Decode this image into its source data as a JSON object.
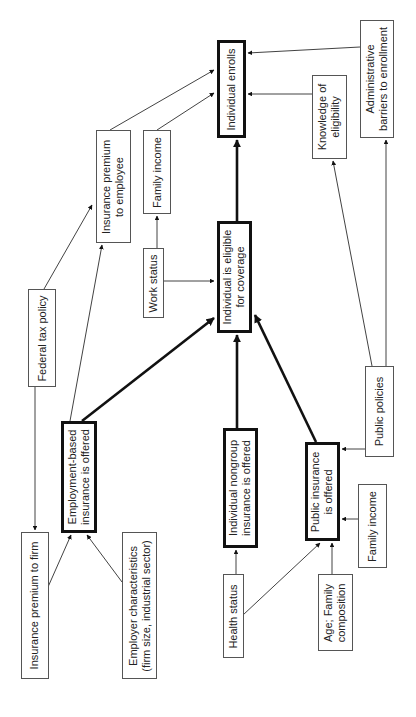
{
  "diagram": {
    "title": "",
    "type": "flowchart",
    "orientation": "rotated-90-ccw",
    "nodes": {
      "individual_enrolls": {
        "lines": [
          "Individual enrolls"
        ],
        "emphasis": "thick"
      },
      "admin_barriers": {
        "lines": [
          "Administrative",
          "barriers to enrollment"
        ],
        "emphasis": "thin"
      },
      "knowledge_eligibility": {
        "lines": [
          "Knowledge of",
          "eligibility"
        ],
        "emphasis": "thin"
      },
      "premium_employee": {
        "lines": [
          "Insurance premium",
          "to employee"
        ],
        "emphasis": "thin"
      },
      "family_income_top": {
        "lines": [
          "Family income"
        ],
        "emphasis": "thin"
      },
      "work_status": {
        "lines": [
          "Work status"
        ],
        "emphasis": "thin"
      },
      "individual_eligible": {
        "lines": [
          "Individual is eligible",
          "for coverage"
        ],
        "emphasis": "thick"
      },
      "federal_tax": {
        "lines": [
          "Federal tax policy"
        ],
        "emphasis": "thin"
      },
      "public_policies": {
        "lines": [
          "Public policies"
        ],
        "emphasis": "thin"
      },
      "employment_based": {
        "lines": [
          "Employment-based",
          "insurance is offered"
        ],
        "emphasis": "thick"
      },
      "nongroup": {
        "lines": [
          "Individual nongroup",
          "insurance is offered"
        ],
        "emphasis": "thick"
      },
      "public_insurance": {
        "lines": [
          "Public insurance",
          "is offered"
        ],
        "emphasis": "thick"
      },
      "premium_firm": {
        "lines": [
          "Insurance premium to firm"
        ],
        "emphasis": "thin"
      },
      "employer_chars": {
        "lines": [
          "Employer characteristics",
          "(firm size, industrial sector)"
        ],
        "emphasis": "thin"
      },
      "health_status": {
        "lines": [
          "Health status"
        ],
        "emphasis": "thin"
      },
      "age_family": {
        "lines": [
          "Age; Family",
          "composition"
        ],
        "emphasis": "thin"
      },
      "family_income_bottom": {
        "lines": [
          "Family income"
        ],
        "emphasis": "thin"
      }
    },
    "edges": [
      {
        "from": "individual_eligible",
        "to": "individual_enrolls",
        "weight": "thick"
      },
      {
        "from": "employment_based",
        "to": "individual_eligible",
        "weight": "thick"
      },
      {
        "from": "nongroup",
        "to": "individual_eligible",
        "weight": "thick"
      },
      {
        "from": "public_insurance",
        "to": "individual_eligible",
        "weight": "thick"
      },
      {
        "from": "admin_barriers",
        "to": "individual_enrolls",
        "weight": "thin"
      },
      {
        "from": "knowledge_eligibility",
        "to": "individual_enrolls",
        "weight": "thin"
      },
      {
        "from": "premium_employee",
        "to": "individual_enrolls",
        "weight": "thin"
      },
      {
        "from": "family_income_top",
        "to": "individual_enrolls",
        "weight": "thin"
      },
      {
        "from": "work_status",
        "to": "family_income_top",
        "weight": "thin"
      },
      {
        "from": "work_status",
        "to": "individual_eligible",
        "weight": "thin"
      },
      {
        "from": "federal_tax",
        "to": "premium_employee",
        "weight": "thin"
      },
      {
        "from": "federal_tax",
        "to": "premium_firm",
        "weight": "thin"
      },
      {
        "from": "employment_based",
        "to": "premium_employee",
        "weight": "thin"
      },
      {
        "from": "premium_firm",
        "to": "employment_based",
        "weight": "thin"
      },
      {
        "from": "employer_chars",
        "to": "employment_based",
        "weight": "thin"
      },
      {
        "from": "health_status",
        "to": "nongroup",
        "weight": "thin"
      },
      {
        "from": "health_status",
        "to": "public_insurance",
        "weight": "thin"
      },
      {
        "from": "age_family",
        "to": "public_insurance",
        "weight": "thin"
      },
      {
        "from": "family_income_bottom",
        "to": "public_insurance",
        "weight": "thin"
      },
      {
        "from": "public_policies",
        "to": "public_insurance",
        "weight": "thin"
      },
      {
        "from": "public_policies",
        "to": "knowledge_eligibility",
        "weight": "thin"
      },
      {
        "from": "public_policies",
        "to": "admin_barriers",
        "weight": "thin"
      }
    ]
  }
}
